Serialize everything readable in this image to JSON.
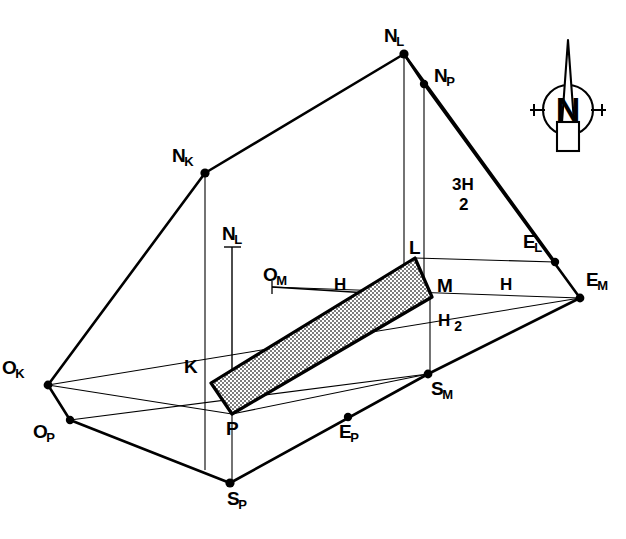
{
  "diagram": {
    "background_color": "#ffffff",
    "line_color": "#000000",
    "hatch_fill_color": "#b8b8b8",
    "vertices": [
      {
        "id": "NL_apex",
        "base": "N",
        "sub": "L",
        "x": 404,
        "y": 54,
        "label_x": 384,
        "label_y": 26,
        "dot": true
      },
      {
        "id": "NP",
        "base": "N",
        "sub": "P",
        "x": 424,
        "y": 84,
        "label_x": 434,
        "label_y": 66,
        "dot": true
      },
      {
        "id": "NK",
        "base": "N",
        "sub": "K",
        "x": 205,
        "y": 173,
        "label_x": 172,
        "label_y": 146,
        "dot": true
      },
      {
        "id": "EL",
        "base": "E",
        "sub": "L",
        "x": 555,
        "y": 262,
        "label_x": 523,
        "label_y": 232,
        "dot": true
      },
      {
        "id": "EM",
        "base": "E",
        "sub": "M",
        "x": 580,
        "y": 298,
        "label_x": 586,
        "label_y": 270,
        "dot": true
      },
      {
        "id": "OK",
        "base": "O",
        "sub": "K",
        "x": 48,
        "y": 385,
        "label_x": 2,
        "label_y": 358,
        "dot": true
      },
      {
        "id": "OP",
        "base": "O",
        "sub": "P",
        "x": 70,
        "y": 420,
        "label_x": 33,
        "label_y": 422,
        "dot": true
      },
      {
        "id": "SM",
        "base": "S",
        "sub": "M",
        "x": 428,
        "y": 374,
        "label_x": 431,
        "label_y": 379,
        "dot": true
      },
      {
        "id": "SP",
        "base": "S",
        "sub": "P",
        "x": 230,
        "y": 483,
        "label_x": 227,
        "label_y": 489,
        "dot": true
      },
      {
        "id": "EP",
        "base": "E",
        "sub": "P",
        "x": 348,
        "y": 417,
        "label_x": 339,
        "label_y": 422,
        "dot": true
      },
      {
        "id": "K",
        "base": "K",
        "sub": "",
        "x": 211,
        "y": 383,
        "label_x": 184,
        "label_y": 357,
        "dot": false
      },
      {
        "id": "L",
        "base": "L",
        "sub": "",
        "x": 415,
        "y": 258,
        "label_x": 409,
        "label_y": 238,
        "dot": false
      },
      {
        "id": "M",
        "base": "M",
        "sub": "",
        "x": 432,
        "y": 297,
        "label_x": 437,
        "label_y": 276,
        "dot": false
      },
      {
        "id": "P",
        "base": "P",
        "sub": "",
        "x": 232,
        "y": 414,
        "label_x": 226,
        "label_y": 419,
        "dot": false
      },
      {
        "id": "OM",
        "base": "O",
        "sub": "M",
        "x": 272,
        "y": 287,
        "label_x": 263,
        "label_y": 265,
        "dot": false
      },
      {
        "id": "NL_ref",
        "base": "N",
        "sub": "L",
        "x": 232,
        "y": 247,
        "label_x": 222,
        "label_y": 224,
        "dot": false
      }
    ],
    "dimensions": [
      {
        "id": "dim-h-left",
        "text": "H",
        "x": 334,
        "y": 276
      },
      {
        "id": "dim-h-right",
        "text": "H",
        "x": 500,
        "y": 276
      }
    ],
    "fractions": [
      {
        "id": "dim-3h-over-2",
        "numerator": "3H",
        "denominator": "2",
        "x": 452,
        "y": 175,
        "style": "stacked"
      },
      {
        "id": "dim-h-over-2",
        "numerator": "H",
        "denominator": "2",
        "x": 438,
        "y": 311,
        "style": "inline"
      }
    ],
    "compass": {
      "id": "north-arrow",
      "letter": "N",
      "x": 568,
      "y": 110
    }
  }
}
